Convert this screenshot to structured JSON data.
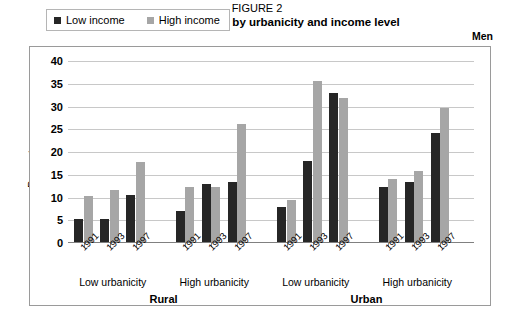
{
  "figure": {
    "number_label": "FIGURE 2",
    "title": "Trends in overweight by urbanicity and income level",
    "sex_label": "Men"
  },
  "legend": {
    "position": "top-left-inside",
    "items": [
      {
        "label": "Low income",
        "color": "#262626"
      },
      {
        "label": "High income",
        "color": "#a6a6a6"
      }
    ]
  },
  "axes": {
    "ylabel": "Percentage",
    "yticks": [
      "0",
      "5",
      "10",
      "15",
      "20",
      "25",
      "30",
      "35",
      "40"
    ]
  },
  "groups": [
    {
      "area": "Rural",
      "urbanicity": "Low urbanicity",
      "years": [
        "1991",
        "1993",
        "1997"
      ]
    },
    {
      "area": "Rural",
      "urbanicity": "High urbanicity",
      "years": [
        "1991",
        "1993",
        "1997"
      ]
    },
    {
      "area": "Urban",
      "urbanicity": "Low urbanicity",
      "years": [
        "1991",
        "1993",
        "1997"
      ]
    },
    {
      "area": "Urban",
      "urbanicity": "High urbanicity",
      "years": [
        "1991",
        "1993",
        "1997"
      ]
    }
  ],
  "areas": [
    {
      "name": "Rural"
    },
    {
      "name": "Urban"
    }
  ],
  "chart_data": {
    "type": "bar",
    "title": "Trends in overweight by urbanicity and income level",
    "subtitle": "FIGURE 2",
    "annotation": "Men",
    "xlabel": "",
    "ylabel": "Percentage",
    "ylim": [
      0,
      40
    ],
    "ytick_step": 5,
    "grid": true,
    "legend_position": "upper left (inside plot)",
    "categories": [
      "Rural / Low urbanicity / 1991",
      "Rural / Low urbanicity / 1993",
      "Rural / Low urbanicity / 1997",
      "Rural / High urbanicity / 1991",
      "Rural / High urbanicity / 1993",
      "Rural / High urbanicity / 1997",
      "Urban / Low urbanicity / 1991",
      "Urban / Low urbanicity / 1993",
      "Urban / Low urbanicity / 1997",
      "Urban / High urbanicity / 1991",
      "Urban / High urbanicity / 1993",
      "Urban / High urbanicity / 1997"
    ],
    "series": [
      {
        "name": "Low income",
        "color": "#262626",
        "values": [
          5.1,
          5.1,
          10.4,
          6.8,
          12.7,
          13.2,
          7.6,
          17.9,
          32.7,
          12.0,
          13.2,
          24.0
        ]
      },
      {
        "name": "High income",
        "color": "#a6a6a6",
        "values": [
          10.1,
          11.4,
          17.6,
          12.2,
          12.0,
          25.9,
          9.2,
          35.3,
          31.7,
          13.9,
          15.6,
          29.5
        ]
      }
    ]
  }
}
